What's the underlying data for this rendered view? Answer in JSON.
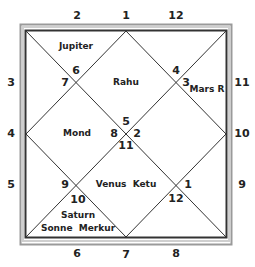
{
  "chart": {
    "type": "north-indian-kundli",
    "outer_numbers": {
      "top": [
        "2",
        "1",
        "12"
      ],
      "right": [
        "11",
        "10",
        "9"
      ],
      "bottom": [
        "6",
        "7",
        "8"
      ],
      "left": [
        "3",
        "4",
        "5"
      ]
    },
    "houses": [
      {
        "house": 1,
        "sign": "5",
        "planets": [
          "Rahu"
        ]
      },
      {
        "house": 2,
        "sign": "6",
        "planets": [
          "Jupiter"
        ]
      },
      {
        "house": 3,
        "sign": "7",
        "planets": []
      },
      {
        "house": 4,
        "sign": "8",
        "planets": [
          "Mond"
        ]
      },
      {
        "house": 5,
        "sign": "9",
        "planets": []
      },
      {
        "house": 6,
        "sign": "10",
        "planets": [
          "Saturn",
          "Sonne",
          "Merkur"
        ]
      },
      {
        "house": 7,
        "sign": "11",
        "planets": [
          "Venus",
          "Ketu"
        ]
      },
      {
        "house": 8,
        "sign": "12",
        "planets": []
      },
      {
        "house": 9,
        "sign": "1",
        "planets": []
      },
      {
        "house": 10,
        "sign": "2",
        "planets": []
      },
      {
        "house": 11,
        "sign": "3",
        "planets": [
          "Mars R"
        ]
      },
      {
        "house": 12,
        "sign": "4",
        "planets": []
      }
    ],
    "planet_labels": {
      "jupiter": "Jupiter",
      "rahu": "Rahu",
      "mars": "Mars R",
      "mond": "Mond",
      "venus_ketu": "Venus  Ketu",
      "saturn": "Saturn",
      "sonne_merkur": "Sonne  Merkur"
    },
    "sign_numbers": {
      "s6": "6",
      "s7": "7",
      "s4": "4",
      "s3": "3",
      "s5": "5",
      "s8": "8",
      "s2": "2",
      "s11": "11",
      "s9": "9",
      "s10": "10",
      "s1": "1",
      "s12": "12"
    }
  }
}
